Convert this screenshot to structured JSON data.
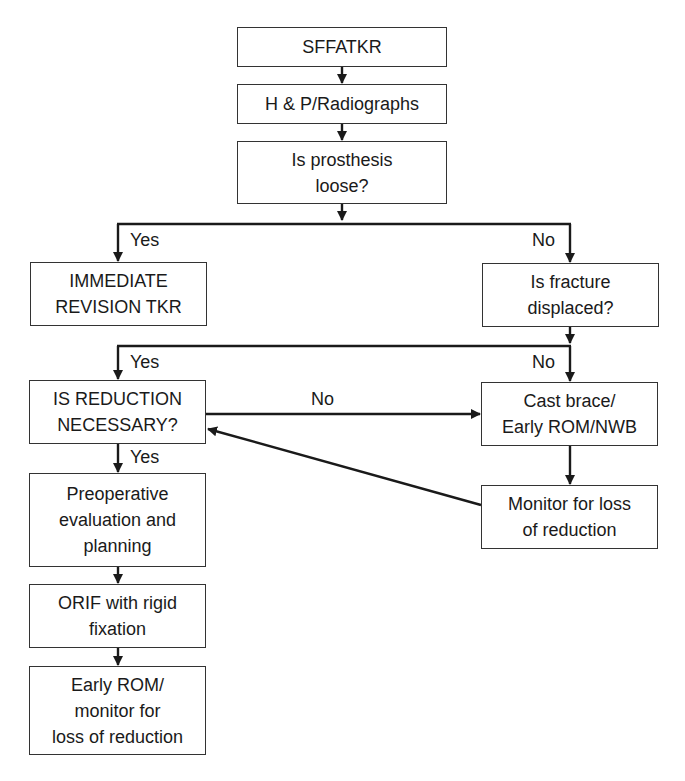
{
  "nodes": {
    "sffatkr": "SFFATKR",
    "history": "H & P/Radiographs",
    "prosthesis_loose": "Is prosthesis\nloose?",
    "immediate_revision": "IMMEDIATE\nREVISION TKR",
    "fracture_displaced": "Is fracture\ndisplaced?",
    "reduction_necessary": "IS REDUCTION\nNECESSARY?",
    "cast_brace": "Cast brace/\nEarly ROM/NWB",
    "monitor_loss": "Monitor for loss\nof reduction",
    "preoperative": "Preoperative\nevaluation and\nplanning",
    "orif": "ORIF with rigid\nfixation",
    "early_rom": "Early ROM/\nmonitor for\nloss of reduction"
  },
  "edge_labels": {
    "loose_yes": "Yes",
    "loose_no": "No",
    "displaced_yes": "Yes",
    "displaced_no": "No",
    "reduction_no": "No",
    "reduction_yes": "Yes"
  },
  "colors": {
    "line": "#1a1a1a",
    "box_border": "#333333",
    "background": "#ffffff"
  }
}
